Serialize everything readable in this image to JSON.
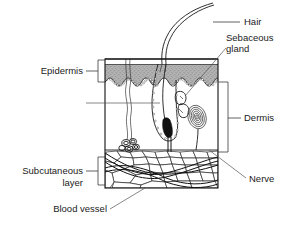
{
  "diagram": {
    "type": "anatomical-cross-section",
    "background_color": "#ffffff",
    "ink_color": "#1a1a1a",
    "epidermis_fill": "#a8a8a8",
    "labels": {
      "hair": "Hair",
      "sebaceous_gland_line1": "Sebaceous",
      "sebaceous_gland_line2": "gland",
      "epidermis": "Epidermis",
      "dermis": "Dermis",
      "subcutaneous_line1": "Subcutaneous",
      "subcutaneous_line2": "layer",
      "blood_vessel": "Blood vessel",
      "nerve": "Nerve"
    },
    "layers": [
      {
        "name": "Epidermis",
        "position": "top",
        "fill": "#a8a8a8",
        "label_side": "left"
      },
      {
        "name": "Dermis",
        "position": "middle",
        "fill": "#ffffff",
        "label_side": "right"
      },
      {
        "name": "Subcutaneous layer",
        "position": "bottom",
        "fill": "#ffffff",
        "label_side": "left"
      }
    ],
    "structures": [
      {
        "name": "Hair",
        "label_side": "right"
      },
      {
        "name": "Sebaceous gland",
        "label_side": "right"
      },
      {
        "name": "Nerve",
        "label_side": "right"
      },
      {
        "name": "Blood vessel",
        "label_side": "left"
      },
      {
        "name": "Sweat gland",
        "label_side": "none"
      },
      {
        "name": "Hair follicle",
        "label_side": "none"
      },
      {
        "name": "Pacinian corpuscle",
        "label_side": "none"
      }
    ]
  }
}
